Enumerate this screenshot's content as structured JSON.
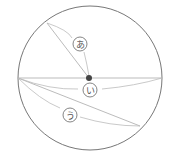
{
  "diagram": {
    "labels": {
      "a": "あ",
      "i": "い",
      "u": "う"
    },
    "colors": {
      "circle": "#777777",
      "chord": "#aaaaaa",
      "arc": "#bbbbbb",
      "center_dot": "#444444",
      "label_ring": "#666666"
    }
  }
}
